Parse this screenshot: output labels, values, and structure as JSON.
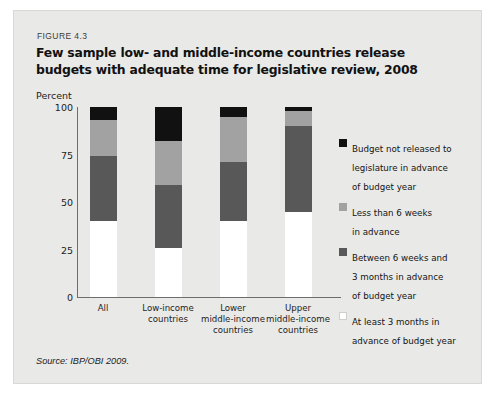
{
  "figure": {
    "number": "FIGURE 4.3",
    "title": "Few sample low- and middle-income countries release budgets with adequate time for legislative review, 2008",
    "source": "Source: IBP/OBI 2009."
  },
  "chart_data": {
    "type": "bar",
    "stacked": true,
    "title": "Few sample low- and middle-income countries release budgets with adequate time for legislative review, 2008",
    "xlabel": "",
    "ylabel": "Percent",
    "ylim": [
      0,
      100
    ],
    "yticks": [
      0,
      25,
      50,
      75,
      100
    ],
    "grid": false,
    "legend_position": "right",
    "categories": [
      "All",
      "Low-income countries",
      "Lower middle-income countries",
      "Upper middle-income countries"
    ],
    "category_lines": [
      [
        "All"
      ],
      [
        "Low-income",
        "countries"
      ],
      [
        "Lower",
        "middle-income",
        "countries"
      ],
      [
        "Upper",
        "middle-income",
        "countries"
      ]
    ],
    "series": [
      {
        "name": "At least 3 months in advance of budget year",
        "color": "#ffffff",
        "values": [
          40,
          26,
          40,
          45
        ]
      },
      {
        "name": "Between 6 weeks and 3 months in advance of budget year",
        "color": "#585858",
        "values": [
          34,
          33,
          31,
          45
        ]
      },
      {
        "name": "Less than 6 weeks in advance",
        "color": "#a2a2a2",
        "values": [
          19,
          23,
          24,
          8
        ]
      },
      {
        "name": "Budget not released to legislature in advance of budget year",
        "color": "#111111",
        "values": [
          7,
          18,
          5,
          2
        ]
      }
    ],
    "legend": [
      {
        "color": "#111111",
        "lines": [
          "Budget not released to",
          "legislature in advance",
          "of budget year"
        ]
      },
      {
        "color": "#a2a2a2",
        "lines": [
          "Less than 6 weeks",
          "in advance"
        ]
      },
      {
        "color": "#585858",
        "lines": [
          "Between 6 weeks and",
          "3 months in advance",
          "of budget year"
        ]
      },
      {
        "color": "#ffffff",
        "lines": [
          "At least 3 months in",
          "advance of budget year"
        ]
      }
    ]
  },
  "axis": {
    "unit_label": "Percent",
    "y_tick_labels": [
      "100",
      "75",
      "50",
      "25",
      "0"
    ]
  }
}
